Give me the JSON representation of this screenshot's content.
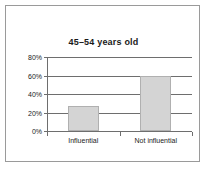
{
  "chart_data": {
    "type": "bar",
    "title": "45–54 years old",
    "categories": [
      "Influential",
      "Not influential"
    ],
    "values": [
      27,
      60
    ],
    "xlabel": "",
    "ylabel": "",
    "ylim": [
      0,
      80
    ],
    "ytick_values": [
      0,
      20,
      40,
      60,
      80
    ],
    "ytick_labels": [
      "0%",
      "20%",
      "40%",
      "60%",
      "80%"
    ],
    "grid": true,
    "legend": false,
    "bar_fill_color": "#d4d4d4",
    "bar_border_color": "#b0b0b0",
    "axis_color": "#6e6e6e",
    "frame_color": "#9a9a9a",
    "background_color": "#ffffff"
  }
}
